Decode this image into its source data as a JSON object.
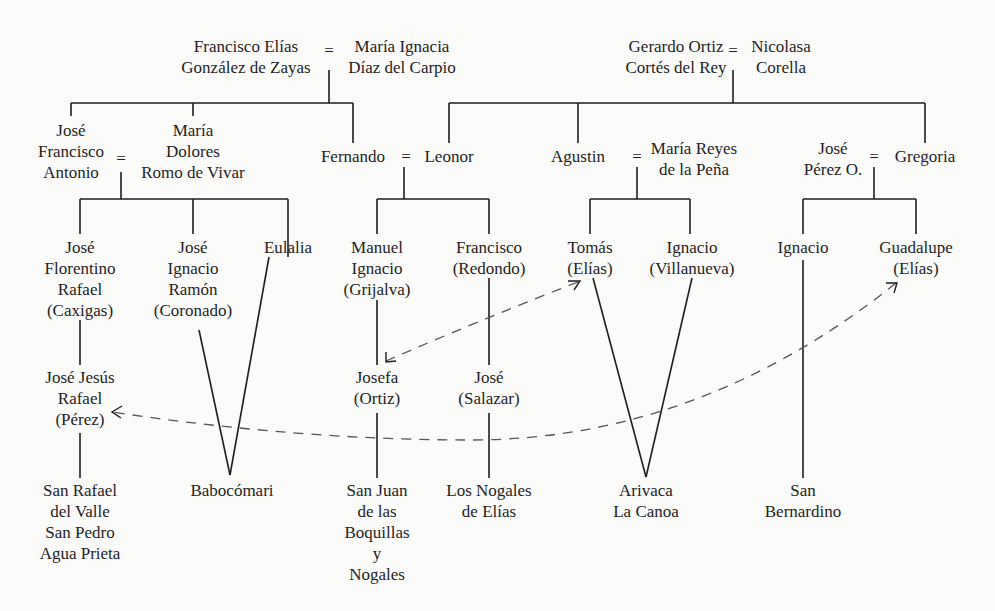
{
  "diagram": {
    "type": "genealogy-tree",
    "line_color": "#1e1e1e",
    "dashed_color": "#555555",
    "background": "#fbfbfa",
    "marriage_symbol": "=",
    "people": {
      "francisco_elias": {
        "lines": [
          "Francisco Elías",
          "González de Zayas"
        ]
      },
      "maria_ignacia": {
        "lines": [
          "María Ignacia",
          "Díaz del Carpio"
        ]
      },
      "gerardo_ortiz": {
        "lines": [
          "Gerardo Ortiz",
          "Cortés del Rey"
        ]
      },
      "nicolasa": {
        "lines": [
          "Nicolasa",
          "Corella"
        ]
      },
      "jose_francisco_antonio": {
        "lines": [
          "José",
          "Francisco",
          "Antonio"
        ]
      },
      "maria_dolores": {
        "lines": [
          "María",
          "Dolores",
          "Romo de Vivar"
        ]
      },
      "fernando": {
        "lines": [
          "Fernando"
        ]
      },
      "leonor": {
        "lines": [
          "Leonor"
        ]
      },
      "agustin": {
        "lines": [
          "Agustin"
        ]
      },
      "maria_reyes": {
        "lines": [
          "María Reyes",
          "de la Peña"
        ]
      },
      "jose_perez": {
        "lines": [
          "José",
          "Pérez O."
        ]
      },
      "gregoria": {
        "lines": [
          "Gregoria"
        ]
      },
      "jose_florentino": {
        "lines": [
          "José",
          "Florentino",
          "Rafael",
          "(Caxigas)"
        ]
      },
      "jose_ignacio_ramon": {
        "lines": [
          "José",
          "Ignacio",
          "Ramón",
          "(Coronado)"
        ]
      },
      "eulalia": {
        "lines": [
          "Eulalia"
        ]
      },
      "manuel_ignacio": {
        "lines": [
          "Manuel",
          "Ignacio",
          "(Grijalva)"
        ]
      },
      "francisco_redondo": {
        "lines": [
          "Francisco",
          "(Redondo)"
        ]
      },
      "tomas": {
        "lines": [
          "Tomás",
          "(Elías)"
        ]
      },
      "ignacio_villanueva": {
        "lines": [
          "Ignacio",
          "(Villanueva)"
        ]
      },
      "ignacio": {
        "lines": [
          "Ignacio"
        ]
      },
      "guadalupe": {
        "lines": [
          "Guadalupe",
          "(Elías)"
        ]
      },
      "jose_jesus_rafael": {
        "lines": [
          "José Jesús",
          "Rafael",
          "(Pérez)"
        ]
      },
      "josefa": {
        "lines": [
          "Josefa",
          "(Ortiz)"
        ]
      },
      "jose_salazar": {
        "lines": [
          "José",
          "(Salazar)"
        ]
      }
    },
    "places": {
      "san_rafael": {
        "lines": [
          "San Rafael",
          "del Valle",
          "San Pedro",
          "Agua Prieta"
        ]
      },
      "babocomari": {
        "lines": [
          "Babocómari"
        ]
      },
      "san_juan": {
        "lines": [
          "San Juan",
          "de las",
          "Boquillas",
          "y",
          "Nogales"
        ]
      },
      "los_nogales": {
        "lines": [
          "Los Nogales",
          "de Elías"
        ]
      },
      "arivaca": {
        "lines": [
          "Arivaca",
          "La Canoa"
        ]
      },
      "san_bernardino": {
        "lines": [
          "San Bernardino"
        ]
      }
    },
    "marriages": [
      [
        "Francisco Elías González de Zayas",
        "María Ignacia Díaz del Carpio"
      ],
      [
        "Gerardo Ortiz Cortés del Rey",
        "Nicolasa Corella"
      ],
      [
        "José Francisco Antonio",
        "María Dolores Romo de Vivar"
      ],
      [
        "Fernando",
        "Leonor"
      ],
      [
        "Agustin",
        "María Reyes de la Peña"
      ],
      [
        "José Pérez O.",
        "Gregoria"
      ]
    ],
    "marriage_links_dashed": [
      [
        "Manuel Ignacio (Grijalva)",
        "Josefa (Ortiz)",
        "Tomás (Elías)"
      ],
      [
        "José Jesús Rafael (Pérez)",
        "Guadalupe (Elías)"
      ]
    ]
  }
}
